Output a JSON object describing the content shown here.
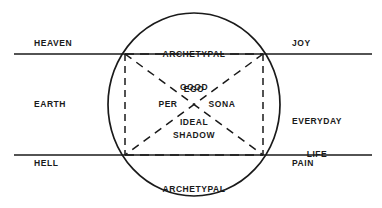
{
  "diagram": {
    "type": "venn-axis-diagram",
    "colors": {
      "stroke": "#1a1a1a",
      "dashed_stroke": "#1a1a1a",
      "background": "#ffffff",
      "text": "#1a1a1a"
    },
    "geometry": {
      "circle": {
        "cx": 194,
        "cy": 104.5,
        "rx": 86,
        "ry": 91.5
      },
      "line_top_y": 54,
      "line_bottom_y": 155,
      "line_x_start": 14,
      "line_x_end": 372,
      "square": {
        "left": 125,
        "right": 263,
        "top": 54,
        "bottom": 155
      }
    },
    "labels": {
      "outer_left": [
        {
          "key": "heaven",
          "text": "HEAVEN",
          "x": 62,
          "y": 44
        },
        {
          "key": "earth",
          "text": "EARTH",
          "x": 55,
          "y": 100
        },
        {
          "key": "hell",
          "text": "HELL",
          "x": 55,
          "y": 159
        }
      ],
      "outer_right": [
        {
          "key": "joy",
          "text": "JOY",
          "x": 292,
          "y": 44
        },
        {
          "key": "everyday_life",
          "line1": "EVERYDAY",
          "line2": "LIFE",
          "x": 317,
          "y": 94
        },
        {
          "key": "pain",
          "text": "PAIN",
          "x": 292,
          "y": 159
        }
      ],
      "inner": [
        {
          "key": "archetypal_good",
          "line1": "ARCHETYPAL",
          "line2": "GOOD",
          "x": 194,
          "y": 27
        },
        {
          "key": "ego_ideal",
          "line1": "EGO",
          "line2": "IDEAL",
          "x": 194,
          "y": 62
        },
        {
          "key": "per",
          "text": "PER",
          "x": 168,
          "y": 100
        },
        {
          "key": "sona",
          "text": "SONA",
          "x": 221,
          "y": 100
        },
        {
          "key": "shadow",
          "text": "SHADOW",
          "x": 194,
          "y": 131
        },
        {
          "key": "archetypal_evil",
          "line1": "ARCHETYPAL",
          "line2": "EVIL",
          "x": 194,
          "y": 163
        }
      ]
    }
  }
}
